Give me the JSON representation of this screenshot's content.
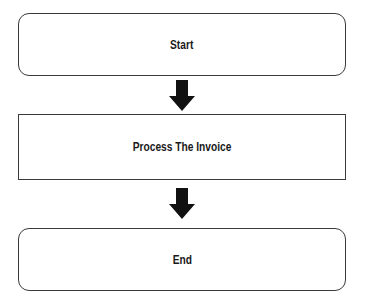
{
  "flowchart": {
    "nodes": [
      {
        "id": "start",
        "label": "Start",
        "shape": "rounded-rectangle"
      },
      {
        "id": "process",
        "label": "Process The Invoice",
        "shape": "rectangle"
      },
      {
        "id": "end",
        "label": "End",
        "shape": "rounded-rectangle"
      }
    ],
    "edges": [
      {
        "from": "start",
        "to": "process",
        "icon": "down-arrow-icon"
      },
      {
        "from": "process",
        "to": "end",
        "icon": "down-arrow-icon"
      }
    ],
    "colors": {
      "stroke": "#3a3a3a",
      "arrow": "#111111",
      "background": "#ffffff"
    }
  }
}
